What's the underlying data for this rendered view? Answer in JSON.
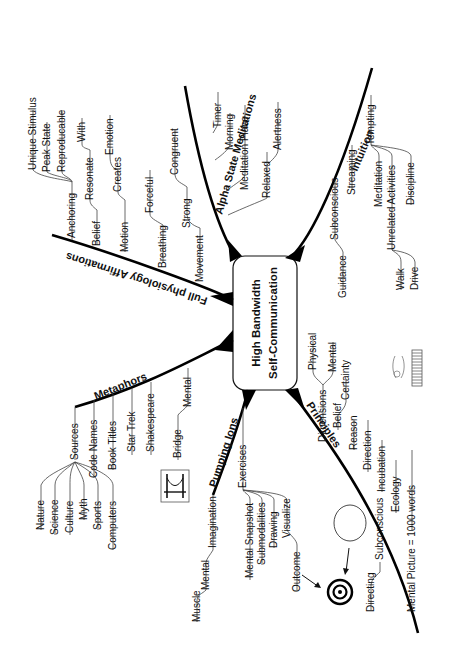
{
  "title": "High Bandwidth Self-Communication",
  "center": {
    "line1": "High Bandwidth",
    "line2": "Self-Communication"
  },
  "branches": {
    "alpha": {
      "label": "Alpha State Meditations",
      "items": [
        "Timer",
        "Morning",
        "Meditation Place",
        "Relaxed",
        "Alertness"
      ]
    },
    "physiology": {
      "label": "Full physiology Affirmations",
      "items": [
        "Anchoring",
        "Unique Stimulus",
        "Peak State",
        "Reproducable",
        "Belief",
        "Resonate",
        "With",
        "Motion",
        "Creates",
        "Emotion",
        "Breathing",
        "Forceful",
        "Movement",
        "Strong",
        "Congruent"
      ]
    },
    "metaphors": {
      "label": "Metaphors",
      "items": [
        "Sources",
        "Code Names",
        "Book Titles",
        "Star Trek",
        "Shakespeare",
        "Bridge",
        "Mental"
      ],
      "sources": [
        "Nature",
        "Science",
        "Culture",
        "Myth",
        "Sports",
        "Computers"
      ]
    },
    "pumping": {
      "label": "Pumping Ions",
      "items": [
        "Exercises",
        "Mental Snapshot",
        "Submodalities",
        "Drawing",
        "Visualize",
        "Outcome",
        "Imagination",
        "Mental",
        "Muscle"
      ]
    },
    "principles": {
      "label": "Principles",
      "items": [
        "Dimensions",
        "Physical",
        "Mental",
        "Belief",
        "Certainty",
        "Reason",
        "Direction",
        "Incubation",
        "Ecology",
        "Mental Picture = 1000 words",
        "Subconscious",
        "Directing"
      ]
    },
    "intuition": {
      "label": "Intuition",
      "items": [
        "Subconscious",
        "Guidance",
        "Streaming",
        "Tempting",
        "Meditation",
        "Unrelated Activities",
        "Discipline",
        "Walk",
        "Drive"
      ]
    }
  },
  "icons": [
    "bridge-icon",
    "target-icon",
    "circle-icon",
    "film-strip-icon",
    "arrow-icon"
  ]
}
